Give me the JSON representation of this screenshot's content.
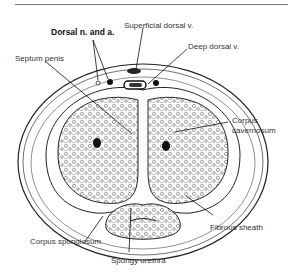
{
  "figure": {
    "type": "anatomical cross-section",
    "labels": {
      "dorsal_n_a": "Dorsal n. and a.",
      "superficial_dorsal_v": "Superficial dorsal v.",
      "deep_dorsal_v": "Deep dorsal v.",
      "septum_penis": "Septum penis",
      "corpus_cavernosum_1": "Corpus",
      "corpus_cavernosum_2": "cavernosum",
      "fibrous_sheath": "Fibrous sheath",
      "corpus_spongiosum": "Corpus spongiosum",
      "spongy_urethra": "Spongy urethra"
    }
  }
}
